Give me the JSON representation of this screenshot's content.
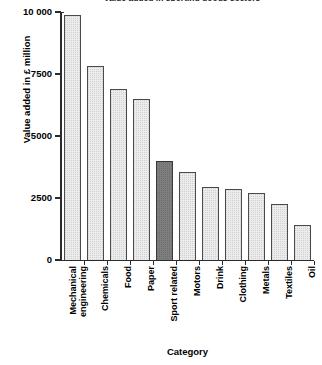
{
  "chart_data": {
    "type": "bar",
    "title": "Value added in sporting goods sectors",
    "xlabel": "Category",
    "ylabel": "Value added in £ million",
    "ylim": [
      0,
      10000
    ],
    "yticks": [
      0,
      2500,
      5000,
      7500,
      10000
    ],
    "ytick_labels": [
      "0",
      "2500",
      "5000",
      "7500",
      "10 000"
    ],
    "grid": false,
    "legend": null,
    "highlight_category": "Sport related",
    "colors": {
      "bar_fill": "#ececec",
      "bar_edge": "#4a4a4a",
      "highlight_fill": "#7e7e7e",
      "axis": "#2b2b2b",
      "text": "#000000"
    },
    "categories": [
      "Mechanical engineering",
      "Chemicals",
      "Food",
      "Paper",
      "Sport related",
      "Motors",
      "Drink",
      "Clothing",
      "Metals",
      "Textiles",
      "Oil"
    ],
    "category_lines": [
      [
        "Mechanical",
        "engineering"
      ],
      [
        "Chemicals"
      ],
      [
        "Food"
      ],
      [
        "Paper"
      ],
      [
        "Sport related"
      ],
      [
        "Motors"
      ],
      [
        "Drink"
      ],
      [
        "Clothing"
      ],
      [
        "Metals"
      ],
      [
        "Textiles"
      ],
      [
        "Oil"
      ]
    ],
    "values": [
      9920,
      7860,
      6950,
      6550,
      4050,
      3600,
      3000,
      2900,
      2750,
      2300,
      1450
    ]
  }
}
